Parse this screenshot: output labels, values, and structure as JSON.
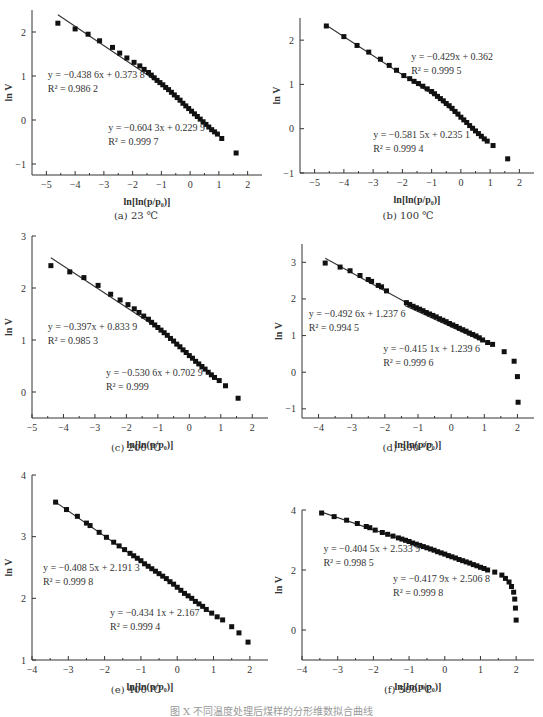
{
  "figure_caption": "图 X  不同温度处理后煤样的分形维数拟合曲线",
  "chart_data": [
    {
      "id": "a",
      "type": "scatter",
      "caption": "(a)  23 ℃",
      "xlabel": "ln[ln(p/p0)]",
      "ylabel": "ln V",
      "xlim": [
        -5.5,
        2.5
      ],
      "ylim": [
        -1.25,
        2.5
      ],
      "xticks": [
        -5,
        -4,
        -3,
        -2,
        -1,
        0,
        1,
        2
      ],
      "yticks": [
        -1,
        0,
        1,
        2
      ],
      "fits": [
        {
          "equation": "y = −0.438 6x + 0.373 8",
          "r2": "R² = 0.986 2",
          "slope": -0.4386,
          "intercept": 0.3738,
          "x_range": [
            -4.6,
            -1.0
          ]
        },
        {
          "equation": "y = −0.604 3x + 0.229 9",
          "r2": "R² = 0.999 7",
          "slope": -0.6043,
          "intercept": 0.2299,
          "x_range": [
            -1.3,
            0.95
          ]
        }
      ],
      "points": [
        [
          -4.6,
          2.2
        ],
        [
          -4.0,
          2.07
        ],
        [
          -3.55,
          1.95
        ],
        [
          -3.15,
          1.8
        ],
        [
          -2.7,
          1.65
        ],
        [
          -2.45,
          1.52
        ],
        [
          -2.2,
          1.41
        ],
        [
          -1.95,
          1.31
        ],
        [
          -1.75,
          1.23
        ],
        [
          -1.6,
          1.15
        ],
        [
          -1.45,
          1.08
        ],
        [
          -1.35,
          1.02
        ],
        [
          -1.25,
          0.96
        ],
        [
          -1.15,
          0.9
        ],
        [
          -1.05,
          0.85
        ],
        [
          -0.95,
          0.8
        ],
        [
          -0.85,
          0.74
        ],
        [
          -0.75,
          0.69
        ],
        [
          -0.65,
          0.63
        ],
        [
          -0.55,
          0.57
        ],
        [
          -0.45,
          0.51
        ],
        [
          -0.35,
          0.45
        ],
        [
          -0.25,
          0.38
        ],
        [
          -0.15,
          0.32
        ],
        [
          -0.05,
          0.26
        ],
        [
          0.05,
          0.2
        ],
        [
          0.15,
          0.14
        ],
        [
          0.25,
          0.08
        ],
        [
          0.35,
          0.02
        ],
        [
          0.45,
          -0.04
        ],
        [
          0.55,
          -0.1
        ],
        [
          0.65,
          -0.16
        ],
        [
          0.75,
          -0.22
        ],
        [
          0.85,
          -0.27
        ],
        [
          0.95,
          -0.32
        ],
        [
          1.1,
          -0.42
        ],
        [
          1.6,
          -0.75
        ]
      ],
      "annotations": [
        {
          "x": -4.95,
          "y": 0.95
        },
        {
          "x": -2.85,
          "y": -0.25
        }
      ]
    },
    {
      "id": "b",
      "type": "scatter",
      "caption": "(b)  100 ℃",
      "xlabel": "ln[ln(p/p0)]",
      "ylabel": "ln V",
      "xlim": [
        -5.5,
        2.5
      ],
      "ylim": [
        -1.0,
        2.5
      ],
      "xticks": [
        -5,
        -4,
        -3,
        -2,
        -1,
        0,
        1,
        2
      ],
      "yticks": [
        -1,
        0,
        1,
        2
      ],
      "fits": [
        {
          "equation": "y = −0.429x + 0.362",
          "r2": "R² = 0.999 5",
          "slope": -0.429,
          "intercept": 0.362,
          "x_range": [
            -4.6,
            -0.5
          ]
        },
        {
          "equation": "y = −0.581 5x + 0.235 1",
          "r2": "R² = 0.999 4",
          "slope": -0.5815,
          "intercept": 0.2351,
          "x_range": [
            -0.6,
            0.95
          ]
        }
      ],
      "points": [
        [
          -4.6,
          2.32
        ],
        [
          -4.0,
          2.08
        ],
        [
          -3.55,
          1.88
        ],
        [
          -3.15,
          1.73
        ],
        [
          -2.75,
          1.57
        ],
        [
          -2.45,
          1.43
        ],
        [
          -2.2,
          1.32
        ],
        [
          -1.95,
          1.2
        ],
        [
          -1.75,
          1.13
        ],
        [
          -1.6,
          1.07
        ],
        [
          -1.45,
          1.02
        ],
        [
          -1.3,
          0.96
        ],
        [
          -1.15,
          0.9
        ],
        [
          -1.0,
          0.84
        ],
        [
          -0.9,
          0.79
        ],
        [
          -0.8,
          0.73
        ],
        [
          -0.7,
          0.68
        ],
        [
          -0.6,
          0.63
        ],
        [
          -0.5,
          0.57
        ],
        [
          -0.4,
          0.52
        ],
        [
          -0.3,
          0.46
        ],
        [
          -0.2,
          0.39
        ],
        [
          -0.1,
          0.33
        ],
        [
          0.0,
          0.26
        ],
        [
          0.1,
          0.2
        ],
        [
          0.2,
          0.14
        ],
        [
          0.3,
          0.07
        ],
        [
          0.4,
          0.01
        ],
        [
          0.5,
          -0.05
        ],
        [
          0.6,
          -0.11
        ],
        [
          0.7,
          -0.17
        ],
        [
          0.8,
          -0.23
        ],
        [
          0.9,
          -0.28
        ],
        [
          1.1,
          -0.38
        ],
        [
          1.6,
          -0.68
        ]
      ],
      "annotations": [
        {
          "x": -1.7,
          "y": 1.55
        },
        {
          "x": -3.0,
          "y": -0.2
        }
      ]
    },
    {
      "id": "c",
      "type": "scatter",
      "caption": "(c)  200 ℃",
      "xlabel": "ln[ln(p/p0)]",
      "ylabel": "ln V",
      "xlim": [
        -5.0,
        2.5
      ],
      "ylim": [
        -0.5,
        3.0
      ],
      "xticks": [
        -5,
        -4,
        -3,
        -2,
        -1,
        0,
        1,
        2
      ],
      "yticks": [
        0,
        1,
        2,
        3
      ],
      "fits": [
        {
          "equation": "y = −0.397x + 0.833 9",
          "r2": "R² = 0.985 3",
          "slope": -0.397,
          "intercept": 0.8339,
          "x_range": [
            -4.4,
            -1.0
          ]
        },
        {
          "equation": "y = −0.530 6x + 0.702 9",
          "r2": "R² = 0.999",
          "slope": -0.5306,
          "intercept": 0.7029,
          "x_range": [
            -1.3,
            0.95
          ]
        }
      ],
      "points": [
        [
          -4.4,
          2.43
        ],
        [
          -3.8,
          2.31
        ],
        [
          -3.35,
          2.2
        ],
        [
          -2.9,
          2.05
        ],
        [
          -2.5,
          1.88
        ],
        [
          -2.2,
          1.77
        ],
        [
          -1.95,
          1.68
        ],
        [
          -1.75,
          1.6
        ],
        [
          -1.6,
          1.53
        ],
        [
          -1.45,
          1.46
        ],
        [
          -1.3,
          1.4
        ],
        [
          -1.2,
          1.34
        ],
        [
          -1.1,
          1.29
        ],
        [
          -1.0,
          1.24
        ],
        [
          -0.9,
          1.19
        ],
        [
          -0.8,
          1.14
        ],
        [
          -0.7,
          1.09
        ],
        [
          -0.6,
          1.03
        ],
        [
          -0.5,
          0.98
        ],
        [
          -0.4,
          0.92
        ],
        [
          -0.3,
          0.87
        ],
        [
          -0.2,
          0.81
        ],
        [
          -0.1,
          0.76
        ],
        [
          0.0,
          0.7
        ],
        [
          0.1,
          0.65
        ],
        [
          0.2,
          0.59
        ],
        [
          0.3,
          0.54
        ],
        [
          0.4,
          0.49
        ],
        [
          0.5,
          0.44
        ],
        [
          0.6,
          0.38
        ],
        [
          0.7,
          0.33
        ],
        [
          0.8,
          0.28
        ],
        [
          0.95,
          0.22
        ],
        [
          1.15,
          0.12
        ],
        [
          1.55,
          -0.12
        ]
      ],
      "annotations": [
        {
          "x": -4.5,
          "y": 1.2
        },
        {
          "x": -2.65,
          "y": 0.3
        }
      ]
    },
    {
      "id": "d",
      "type": "scatter",
      "caption": "(d)  300 ℃",
      "xlabel": "ln[ln(p/p0)]",
      "ylabel": "ln V",
      "xlim": [
        -4.5,
        2.5
      ],
      "ylim": [
        -1.25,
        3.5
      ],
      "xticks": [
        -4,
        -3,
        -2,
        -1,
        0,
        1,
        2
      ],
      "yticks": [
        -1,
        0,
        1,
        2,
        3
      ],
      "fits": [
        {
          "equation": "y = −0.492 6x + 1.237 6",
          "r2": "R² = 0.994 5",
          "slope": -0.4926,
          "intercept": 1.2376,
          "x_range": [
            -3.8,
            -1.3
          ]
        },
        {
          "equation": "y = −0.415 1x + 1.239 6",
          "r2": "R² = 0.999 6",
          "slope": -0.4151,
          "intercept": 1.2396,
          "x_range": [
            -1.4,
            0.9
          ]
        }
      ],
      "points": [
        [
          -3.8,
          2.98
        ],
        [
          -3.35,
          2.87
        ],
        [
          -3.05,
          2.77
        ],
        [
          -2.75,
          2.64
        ],
        [
          -2.5,
          2.53
        ],
        [
          -2.4,
          2.48
        ],
        [
          -2.2,
          2.37
        ],
        [
          -2.1,
          2.33
        ],
        [
          -1.95,
          2.22
        ],
        [
          -1.35,
          1.9
        ],
        [
          -1.25,
          1.85
        ],
        [
          -1.15,
          1.8
        ],
        [
          -1.05,
          1.76
        ],
        [
          -0.95,
          1.72
        ],
        [
          -0.85,
          1.68
        ],
        [
          -0.75,
          1.63
        ],
        [
          -0.65,
          1.59
        ],
        [
          -0.55,
          1.55
        ],
        [
          -0.45,
          1.51
        ],
        [
          -0.35,
          1.46
        ],
        [
          -0.25,
          1.42
        ],
        [
          -0.15,
          1.38
        ],
        [
          -0.05,
          1.33
        ],
        [
          0.05,
          1.29
        ],
        [
          0.15,
          1.25
        ],
        [
          0.25,
          1.2
        ],
        [
          0.35,
          1.16
        ],
        [
          0.45,
          1.12
        ],
        [
          0.55,
          1.07
        ],
        [
          0.65,
          1.03
        ],
        [
          0.75,
          0.99
        ],
        [
          0.85,
          0.94
        ],
        [
          0.95,
          0.88
        ],
        [
          1.1,
          0.81
        ],
        [
          1.25,
          0.76
        ],
        [
          1.6,
          0.56
        ],
        [
          1.9,
          0.3
        ],
        [
          2.0,
          -0.12
        ],
        [
          2.02,
          -0.82
        ]
      ],
      "annotations": [
        {
          "x": -4.3,
          "y": 1.5
        },
        {
          "x": -2.05,
          "y": 0.55
        }
      ]
    },
    {
      "id": "e",
      "type": "scatter",
      "caption": "(e)  400 ℃",
      "xlabel": "ln[ln(p/p0)]",
      "ylabel": "ln V",
      "xlim": [
        -4.0,
        2.5
      ],
      "ylim": [
        1.0,
        4.0
      ],
      "xticks": [
        -4,
        -3,
        -2,
        -1,
        0,
        1,
        2
      ],
      "yticks": [
        1,
        2,
        3,
        4
      ],
      "fits": [
        {
          "equation": "y = −0.408 5x + 2.191 3",
          "r2": "R² = 0.999 8",
          "slope": -0.4085,
          "intercept": 2.1913,
          "x_range": [
            -3.35,
            0.0
          ]
        },
        {
          "equation": "y = −0.434 1x + 2.167",
          "r2": "R² = 0.999 4",
          "slope": -0.4341,
          "intercept": 2.167,
          "x_range": [
            -0.3,
            0.95
          ]
        }
      ],
      "points": [
        [
          -3.35,
          3.56
        ],
        [
          -3.05,
          3.44
        ],
        [
          -2.75,
          3.33
        ],
        [
          -2.5,
          3.22
        ],
        [
          -2.4,
          3.18
        ],
        [
          -2.15,
          3.07
        ],
        [
          -1.95,
          2.99
        ],
        [
          -1.75,
          2.91
        ],
        [
          -1.6,
          2.85
        ],
        [
          -1.45,
          2.79
        ],
        [
          -1.3,
          2.73
        ],
        [
          -1.2,
          2.69
        ],
        [
          -1.1,
          2.65
        ],
        [
          -1.0,
          2.61
        ],
        [
          -0.9,
          2.56
        ],
        [
          -0.8,
          2.52
        ],
        [
          -0.7,
          2.48
        ],
        [
          -0.6,
          2.44
        ],
        [
          -0.5,
          2.4
        ],
        [
          -0.4,
          2.36
        ],
        [
          -0.3,
          2.32
        ],
        [
          -0.2,
          2.27
        ],
        [
          -0.1,
          2.23
        ],
        [
          0.0,
          2.18
        ],
        [
          0.1,
          2.13
        ],
        [
          0.2,
          2.08
        ],
        [
          0.3,
          2.04
        ],
        [
          0.4,
          2.0
        ],
        [
          0.5,
          1.95
        ],
        [
          0.6,
          1.91
        ],
        [
          0.7,
          1.87
        ],
        [
          0.8,
          1.82
        ],
        [
          0.95,
          1.76
        ],
        [
          1.1,
          1.7
        ],
        [
          1.25,
          1.65
        ],
        [
          1.5,
          1.54
        ],
        [
          1.7,
          1.44
        ],
        [
          1.95,
          1.29
        ]
      ],
      "annotations": [
        {
          "x": -3.7,
          "y": 2.45
        },
        {
          "x": -1.85,
          "y": 1.72
        }
      ]
    },
    {
      "id": "f",
      "type": "scatter",
      "caption": "(f)  500 ℃",
      "xlabel": "ln[ln(p/p0)]",
      "ylabel": "ln V",
      "xlim": [
        -4.0,
        2.5
      ],
      "ylim": [
        -1.0,
        4.0
      ],
      "xticks": [
        -4,
        -3,
        -2,
        -1,
        0,
        1,
        2
      ],
      "yticks": [
        0,
        2,
        4
      ],
      "fits": [
        {
          "equation": "y = −0.404 5x + 2.533 9",
          "r2": "R² = 0.998 5",
          "slope": -0.4045,
          "intercept": 2.5339,
          "x_range": [
            -3.45,
            0.0
          ]
        },
        {
          "equation": "y = −0.417 9x + 2.506 8",
          "r2": "R² = 0.999 8",
          "slope": -0.4179,
          "intercept": 2.5068,
          "x_range": [
            -0.2,
            1.0
          ]
        }
      ],
      "points": [
        [
          -3.45,
          3.9
        ],
        [
          -3.1,
          3.78
        ],
        [
          -2.75,
          3.66
        ],
        [
          -2.45,
          3.55
        ],
        [
          -2.2,
          3.45
        ],
        [
          -2.1,
          3.41
        ],
        [
          -1.95,
          3.33
        ],
        [
          -1.75,
          3.25
        ],
        [
          -1.6,
          3.19
        ],
        [
          -1.45,
          3.13
        ],
        [
          -1.3,
          3.07
        ],
        [
          -1.2,
          3.03
        ],
        [
          -1.1,
          2.99
        ],
        [
          -1.0,
          2.95
        ],
        [
          -0.9,
          2.9
        ],
        [
          -0.8,
          2.86
        ],
        [
          -0.7,
          2.82
        ],
        [
          -0.6,
          2.78
        ],
        [
          -0.5,
          2.74
        ],
        [
          -0.4,
          2.7
        ],
        [
          -0.3,
          2.66
        ],
        [
          -0.2,
          2.61
        ],
        [
          -0.1,
          2.57
        ],
        [
          0.0,
          2.53
        ],
        [
          0.1,
          2.48
        ],
        [
          0.2,
          2.44
        ],
        [
          0.3,
          2.4
        ],
        [
          0.4,
          2.35
        ],
        [
          0.5,
          2.31
        ],
        [
          0.6,
          2.27
        ],
        [
          0.7,
          2.23
        ],
        [
          0.8,
          2.18
        ],
        [
          0.9,
          2.14
        ],
        [
          1.0,
          2.09
        ],
        [
          1.1,
          2.05
        ],
        [
          1.2,
          2.0
        ],
        [
          1.4,
          1.93
        ],
        [
          1.6,
          1.83
        ],
        [
          1.7,
          1.72
        ],
        [
          1.8,
          1.6
        ],
        [
          1.87,
          1.45
        ],
        [
          1.93,
          1.26
        ],
        [
          1.96,
          1.03
        ],
        [
          1.98,
          0.73
        ],
        [
          2.0,
          0.33
        ]
      ],
      "annotations": [
        {
          "x": -3.4,
          "y": 2.6
        },
        {
          "x": -1.45,
          "y": 1.6
        }
      ]
    }
  ]
}
